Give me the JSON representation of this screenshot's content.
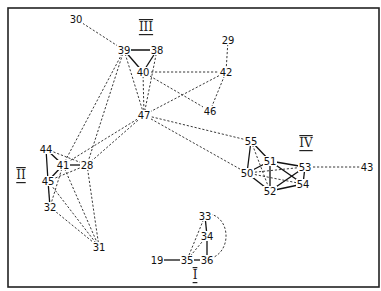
{
  "diagram": {
    "type": "sociogram",
    "frame": {
      "x": 8,
      "y": 8,
      "width": 371,
      "height": 279
    },
    "clusters": [
      {
        "id": "I",
        "label": "I",
        "x": 195,
        "y": 275
      },
      {
        "id": "II",
        "label": "II",
        "x": 21,
        "y": 175
      },
      {
        "id": "III",
        "label": "III",
        "x": 146,
        "y": 27
      },
      {
        "id": "IV",
        "label": "IV",
        "x": 306,
        "y": 143
      }
    ],
    "nodes": [
      {
        "id": "30",
        "label": "30",
        "x": 76,
        "y": 19
      },
      {
        "id": "39",
        "label": "39",
        "x": 124,
        "y": 50
      },
      {
        "id": "38",
        "label": "38",
        "x": 157,
        "y": 50
      },
      {
        "id": "40",
        "label": "40",
        "x": 143,
        "y": 72
      },
      {
        "id": "29",
        "label": "29",
        "x": 228,
        "y": 40
      },
      {
        "id": "42",
        "label": "42",
        "x": 226,
        "y": 72
      },
      {
        "id": "46",
        "label": "46",
        "x": 210,
        "y": 111
      },
      {
        "id": "47",
        "label": "47",
        "x": 144,
        "y": 115
      },
      {
        "id": "44",
        "label": "44",
        "x": 46,
        "y": 149
      },
      {
        "id": "41",
        "label": "41",
        "x": 63,
        "y": 165
      },
      {
        "id": "28",
        "label": "28",
        "x": 87,
        "y": 165
      },
      {
        "id": "45",
        "label": "45",
        "x": 48,
        "y": 181
      },
      {
        "id": "32",
        "label": "32",
        "x": 50,
        "y": 207
      },
      {
        "id": "31",
        "label": "31",
        "x": 99,
        "y": 247
      },
      {
        "id": "55",
        "label": "55",
        "x": 251,
        "y": 141
      },
      {
        "id": "51",
        "label": "51",
        "x": 270,
        "y": 161
      },
      {
        "id": "53",
        "label": "53",
        "x": 305,
        "y": 167
      },
      {
        "id": "50",
        "label": "50",
        "x": 247,
        "y": 173
      },
      {
        "id": "52",
        "label": "52",
        "x": 270,
        "y": 191
      },
      {
        "id": "54",
        "label": "54",
        "x": 303,
        "y": 184
      },
      {
        "id": "43",
        "label": "43",
        "x": 367,
        "y": 167
      },
      {
        "id": "33",
        "label": "33",
        "x": 205,
        "y": 216
      },
      {
        "id": "34",
        "label": "34",
        "x": 207,
        "y": 236
      },
      {
        "id": "35",
        "label": "35",
        "x": 187,
        "y": 260
      },
      {
        "id": "36",
        "label": "36",
        "x": 207,
        "y": 260
      },
      {
        "id": "19",
        "label": "19",
        "x": 157,
        "y": 260
      }
    ],
    "edges": [
      {
        "from": "39",
        "to": "38",
        "style": "solid"
      },
      {
        "from": "39",
        "to": "40",
        "style": "solid"
      },
      {
        "from": "38",
        "to": "40",
        "style": "solid"
      },
      {
        "from": "30",
        "to": "39",
        "style": "dashed"
      },
      {
        "from": "39",
        "to": "47",
        "style": "dashed"
      },
      {
        "from": "38",
        "to": "47",
        "style": "dashed"
      },
      {
        "from": "40",
        "to": "47",
        "style": "dashed"
      },
      {
        "from": "40",
        "to": "42",
        "style": "dashed"
      },
      {
        "from": "40",
        "to": "46",
        "style": "dashed"
      },
      {
        "from": "29",
        "to": "42",
        "style": "dashed"
      },
      {
        "from": "42",
        "to": "46",
        "style": "dashed"
      },
      {
        "from": "42",
        "to": "47",
        "style": "dashed"
      },
      {
        "from": "39",
        "to": "41",
        "style": "dashed"
      },
      {
        "from": "39",
        "to": "28",
        "style": "dashed"
      },
      {
        "from": "47",
        "to": "41",
        "style": "dashed"
      },
      {
        "from": "47",
        "to": "28",
        "style": "dashed"
      },
      {
        "from": "47",
        "to": "55",
        "style": "dashed"
      },
      {
        "from": "47",
        "to": "50",
        "style": "dashed"
      },
      {
        "from": "44",
        "to": "41",
        "style": "solid"
      },
      {
        "from": "44",
        "to": "45",
        "style": "solid"
      },
      {
        "from": "41",
        "to": "45",
        "style": "solid"
      },
      {
        "from": "41",
        "to": "28",
        "style": "solid"
      },
      {
        "from": "45",
        "to": "32",
        "style": "solid"
      },
      {
        "from": "44",
        "to": "28",
        "style": "dashed"
      },
      {
        "from": "45",
        "to": "28",
        "style": "dashed"
      },
      {
        "from": "41",
        "to": "32",
        "style": "dashed"
      },
      {
        "from": "41",
        "to": "31",
        "style": "dashed"
      },
      {
        "from": "45",
        "to": "31",
        "style": "dashed"
      },
      {
        "from": "32",
        "to": "31",
        "style": "dashed"
      },
      {
        "from": "28",
        "to": "31",
        "style": "dashed"
      },
      {
        "from": "55",
        "to": "51",
        "style": "solid"
      },
      {
        "from": "55",
        "to": "50",
        "style": "solid"
      },
      {
        "from": "51",
        "to": "53",
        "style": "solid"
      },
      {
        "from": "51",
        "to": "50",
        "style": "solid"
      },
      {
        "from": "51",
        "to": "52",
        "style": "solid"
      },
      {
        "from": "51",
        "to": "54",
        "style": "solid"
      },
      {
        "from": "53",
        "to": "54",
        "style": "solid"
      },
      {
        "from": "53",
        "to": "52",
        "style": "solid"
      },
      {
        "from": "50",
        "to": "52",
        "style": "solid"
      },
      {
        "from": "52",
        "to": "54",
        "style": "solid"
      },
      {
        "from": "55",
        "to": "52",
        "style": "dashed"
      },
      {
        "from": "50",
        "to": "53",
        "style": "dashed"
      },
      {
        "from": "50",
        "to": "54",
        "style": "dashed"
      },
      {
        "from": "53",
        "to": "43",
        "style": "dashed"
      },
      {
        "from": "19",
        "to": "35",
        "style": "solid"
      },
      {
        "from": "35",
        "to": "36",
        "style": "solid"
      },
      {
        "from": "33",
        "to": "34",
        "style": "solid"
      },
      {
        "from": "34",
        "to": "36",
        "style": "solid"
      },
      {
        "from": "33",
        "to": "35",
        "style": "dashed"
      },
      {
        "from": "34",
        "to": "35",
        "style": "dashed"
      }
    ],
    "curved_edges": [
      {
        "from": "33",
        "to": "36",
        "style": "dashed",
        "path": "M210,214 C230,218 232,250 212,258"
      }
    ]
  }
}
